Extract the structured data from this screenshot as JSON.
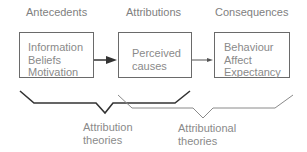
{
  "headings": {
    "antecedents": "Antecedents",
    "attributions": "Attributions",
    "consequences": "Consequences"
  },
  "boxes": [
    {
      "id": "antecedents",
      "lines": [
        "Information",
        "Beliefs",
        "Motivation"
      ]
    },
    {
      "id": "attributions",
      "lines": [
        "Perceived",
        "causes"
      ]
    },
    {
      "id": "consequences",
      "lines": [
        "Behaviour",
        "Affect",
        "Expectancy"
      ]
    }
  ],
  "brackets": {
    "attribution_theories": {
      "lines": [
        "Attribution",
        "theories"
      ],
      "color": "#333333"
    },
    "attributional_theories": {
      "lines": [
        "Attributional",
        "theories"
      ],
      "color": "#8a8a8a"
    }
  },
  "colors": {
    "box_border": "#6a6a6a",
    "text": "#8a8a8a",
    "arrow": "#333333"
  }
}
